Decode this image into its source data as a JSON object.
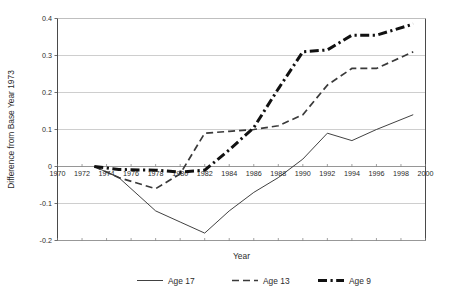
{
  "chart_data": {
    "type": "line",
    "title": "",
    "xlabel": "Year",
    "ylabel": "Difference from Base Year 1973",
    "xlim": [
      1970,
      2000
    ],
    "ylim": [
      -0.2,
      0.4
    ],
    "xticks": [
      1970,
      1972,
      1974,
      1976,
      1978,
      1980,
      1982,
      1984,
      1986,
      1988,
      1990,
      1992,
      1994,
      1996,
      1998,
      2000
    ],
    "yticks": [
      -0.2,
      -0.1,
      0,
      0.1,
      0.2,
      0.3,
      0.4
    ],
    "xtick_labels": [
      "1970",
      "1972",
      "1974",
      "1976",
      "1978",
      "1980",
      "1982",
      "1984",
      "1986",
      "1988",
      "1990",
      "1992",
      "1994",
      "1996",
      "1998",
      "2000"
    ],
    "ytick_labels": [
      "-0.2",
      "-0.1",
      "0",
      "0.1",
      "0.2",
      "0.3",
      "0.4"
    ],
    "grid": true,
    "grid_axis": "y",
    "legend_position": "bottom",
    "series": [
      {
        "name": "Age 17",
        "style": "solid-thin",
        "color": "#2b2b2b",
        "width": 0.9,
        "x": [
          1973,
          1975,
          1978,
          1980,
          1982,
          1984,
          1986,
          1988,
          1990,
          1992,
          1994,
          1996,
          1999
        ],
        "values": [
          0,
          -0.03,
          -0.12,
          -0.15,
          -0.18,
          -0.12,
          -0.07,
          -0.03,
          0.02,
          0.09,
          0.07,
          0.1,
          0.14
        ]
      },
      {
        "name": "Age 13",
        "style": "dashed",
        "color": "#3a3a3a",
        "width": 1.7,
        "x": [
          1973,
          1975,
          1978,
          1980,
          1982,
          1984,
          1986,
          1988,
          1990,
          1992,
          1994,
          1996,
          1999
        ],
        "values": [
          0,
          -0.03,
          -0.06,
          -0.02,
          0.09,
          0.095,
          0.1,
          0.11,
          0.14,
          0.22,
          0.265,
          0.265,
          0.31
        ]
      },
      {
        "name": "Age 9",
        "style": "dash-dot-thick",
        "color": "#111111",
        "width": 3.0,
        "x": [
          1973,
          1975,
          1978,
          1980,
          1982,
          1984,
          1986,
          1988,
          1990,
          1992,
          1994,
          1996,
          1999
        ],
        "values": [
          0,
          -0.008,
          -0.01,
          -0.015,
          -0.01,
          0.045,
          0.105,
          0.21,
          0.31,
          0.315,
          0.355,
          0.355,
          0.385
        ]
      }
    ],
    "legend_entries": [
      {
        "label": "Age 17",
        "style": "solid-thin"
      },
      {
        "label": "Age 13",
        "style": "dashed"
      },
      {
        "label": "Age 9",
        "style": "dash-dot-thick"
      }
    ]
  }
}
